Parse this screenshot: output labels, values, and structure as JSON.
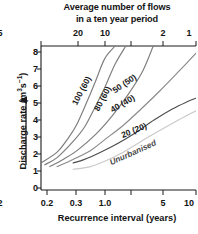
{
  "chart_data": {
    "type": "line",
    "title": "Average number of flows in a ten year period",
    "title_lines": [
      "Average number of flows",
      "in a ten year period"
    ],
    "xlabel": "Recurrence interval (years)",
    "ylabel": "Discharge rate (m³s⁻¹)",
    "ylabel_text": "Discharge rate (m",
    "ylabel_sup": "3",
    "ylabel_unit": "s",
    "ylabel_sup2": "−1",
    "ylabel_close": ")",
    "xscale": "log",
    "xlim": [
      0.2,
      10
    ],
    "ylim": [
      0,
      8
    ],
    "grid": false,
    "legend_position": "inline-curve-labels",
    "x_ticks": [
      {
        "value": 0.2,
        "label": "0.2"
      },
      {
        "value": 0.3,
        "label": "0.3"
      },
      {
        "value": 1.0,
        "label": "1.0"
      },
      {
        "value": 2,
        "label": "2"
      },
      {
        "value": 5,
        "label": "5"
      },
      {
        "value": 10,
        "label": "10"
      }
    ],
    "y_ticks": [
      {
        "value": 0,
        "label": "0"
      },
      {
        "value": 1,
        "label": "1"
      },
      {
        "value": 2,
        "label": "2"
      },
      {
        "value": 3,
        "label": "3"
      },
      {
        "value": 4,
        "label": "4"
      },
      {
        "value": 5,
        "label": "5"
      },
      {
        "value": 6,
        "label": "6"
      },
      {
        "value": 7,
        "label": "7"
      },
      {
        "value": 8,
        "label": "8"
      }
    ],
    "secondary_x_axis": {
      "title_lines": [
        "Average number of flows",
        "in a ten year period"
      ],
      "ticks": [
        {
          "label": "20",
          "recurrence": 0.5
        },
        {
          "label": "10",
          "recurrence": 1.0
        },
        {
          "label": "5",
          "recurrence": 2.0
        },
        {
          "label": "2",
          "recurrence": 5.0
        },
        {
          "label": "1",
          "recurrence": 10.0
        }
      ]
    },
    "series": [
      {
        "name": "100 (60)",
        "label": "100 (60)",
        "color": "#7d7d7d",
        "x": [
          0.2,
          0.3,
          0.4,
          0.5,
          0.65,
          0.8,
          1.0,
          1.3
        ],
        "y": [
          1.5,
          2.1,
          2.9,
          3.7,
          5.0,
          6.1,
          7.3,
          8.0
        ]
      },
      {
        "name": "80 (60)",
        "label": "80 (60)",
        "color": "#7d7d7d",
        "x": [
          0.22,
          0.3,
          0.45,
          0.6,
          0.8,
          1.0,
          1.3,
          1.7
        ],
        "y": [
          1.4,
          1.8,
          2.7,
          3.5,
          4.7,
          5.7,
          7.0,
          8.0
        ]
      },
      {
        "name": "50 (50)",
        "label": "50 (50)",
        "color": "#7d7d7d",
        "x": [
          0.25,
          0.35,
          0.5,
          0.8,
          1.2,
          1.8,
          2.6,
          3.4
        ],
        "y": [
          1.3,
          1.7,
          2.2,
          3.1,
          4.1,
          5.3,
          6.6,
          8.0
        ]
      },
      {
        "name": "40 (40)",
        "label": "40 (40)",
        "color": "#8a8a8a",
        "x": [
          0.3,
          0.45,
          0.7,
          1.0,
          1.6,
          2.5,
          4.0,
          6.5,
          10.0
        ],
        "y": [
          1.3,
          1.7,
          2.2,
          2.8,
          3.6,
          4.5,
          5.5,
          6.6,
          7.6
        ]
      },
      {
        "name": "20 (20)",
        "label": "20 (20)",
        "color": "#4d4d4d",
        "x": [
          0.45,
          0.6,
          0.9,
          1.4,
          2.2,
          3.5,
          5.5,
          8.0,
          10.0
        ],
        "y": [
          1.5,
          1.7,
          2.1,
          2.6,
          3.2,
          3.9,
          4.5,
          4.9,
          5.1
        ]
      },
      {
        "name": "Unurbanised",
        "label": "Unurbanised",
        "color": "#c9c9c9",
        "x": [
          0.45,
          0.7,
          1.0,
          1.6,
          2.5,
          4.0,
          6.5,
          10.0
        ],
        "y": [
          1.15,
          1.3,
          1.6,
          2.1,
          2.7,
          3.3,
          3.9,
          4.4
        ]
      }
    ],
    "curve_label_placements": [
      {
        "name": "100 (60)",
        "x": 84,
        "y": 92,
        "rotate": -62
      },
      {
        "name": "80 (60)",
        "x": 105,
        "y": 100,
        "rotate": -62
      },
      {
        "name": "50 (50)",
        "x": 126,
        "y": 86,
        "rotate": -34
      },
      {
        "name": "40 (40)",
        "x": 124,
        "y": 106,
        "rotate": -30
      },
      {
        "name": "20 (20)",
        "x": 135,
        "y": 133,
        "rotate": -22
      },
      {
        "name": "Unurbanised",
        "x": 134,
        "y": 155,
        "rotate": -24
      }
    ]
  },
  "colors": {
    "axis": "#1a1a1a",
    "text": "#141414",
    "background": "#ffffff",
    "arrow": "#1a1a1a"
  }
}
